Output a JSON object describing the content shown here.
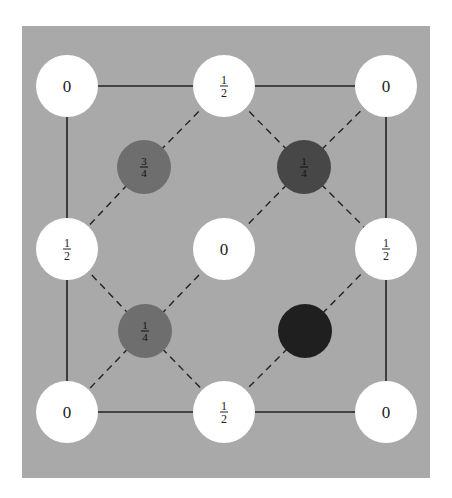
{
  "diagram": {
    "type": "crystal-structure-projection",
    "colors": {
      "page_background": "#ffffff",
      "panel_background": "#a9a9a9",
      "white_atom": "#ffffff",
      "dark_atom_medium": "#6e6e6e",
      "dark_atom_dark": "#474747",
      "dark_atom_darkest": "#1f1f1f",
      "line": "#222222",
      "label": "#222222"
    },
    "panel": {
      "x": 22,
      "y": 26,
      "width": 408,
      "height": 452
    },
    "square": {
      "x1": 67,
      "y1": 86,
      "x2": 386,
      "y2": 412
    },
    "white_atoms": [
      {
        "id": "corner-top-left",
        "cx": 67,
        "cy": 86,
        "label": "0"
      },
      {
        "id": "edge-top",
        "cx": 224,
        "cy": 86,
        "label": "½",
        "num": "1",
        "den": "2"
      },
      {
        "id": "corner-top-right",
        "cx": 386,
        "cy": 86,
        "label": "0"
      },
      {
        "id": "edge-left",
        "cx": 67,
        "cy": 249,
        "label": "½",
        "num": "1",
        "den": "2"
      },
      {
        "id": "center",
        "cx": 224,
        "cy": 249,
        "label": "0"
      },
      {
        "id": "edge-right",
        "cx": 386,
        "cy": 249,
        "label": "½",
        "num": "1",
        "den": "2"
      },
      {
        "id": "corner-bottom-left",
        "cx": 67,
        "cy": 412,
        "label": "0"
      },
      {
        "id": "edge-bottom",
        "cx": 224,
        "cy": 412,
        "label": "½",
        "num": "1",
        "den": "2"
      },
      {
        "id": "corner-bottom-right",
        "cx": 386,
        "cy": 412,
        "label": "0"
      }
    ],
    "white_atom_radius": 31,
    "dark_atoms": [
      {
        "id": "interior-top-left",
        "cx": 144,
        "cy": 167,
        "num": "3",
        "den": "4",
        "shade": "dark_atom_medium"
      },
      {
        "id": "interior-top-right",
        "cx": 304,
        "cy": 167,
        "num": "1",
        "den": "4",
        "shade": "dark_atom_dark"
      },
      {
        "id": "interior-bottom-left",
        "cx": 145,
        "cy": 331,
        "num": "1",
        "den": "4",
        "shade": "dark_atom_medium"
      },
      {
        "id": "interior-bottom-right",
        "cx": 305,
        "cy": 331,
        "num": "",
        "den": "",
        "shade": "dark_atom_darkest"
      }
    ],
    "dark_atom_radius": 27,
    "dashed_bonds": [
      [
        "edge-top",
        "interior-top-left"
      ],
      [
        "interior-top-left",
        "edge-left"
      ],
      [
        "edge-top",
        "interior-top-right"
      ],
      [
        "corner-top-right",
        "interior-top-right"
      ],
      [
        "interior-top-right",
        "center"
      ],
      [
        "interior-top-right",
        "edge-right"
      ],
      [
        "edge-left",
        "interior-bottom-left"
      ],
      [
        "center",
        "interior-bottom-left"
      ],
      [
        "interior-bottom-left",
        "corner-bottom-left"
      ],
      [
        "interior-bottom-left",
        "edge-bottom"
      ],
      [
        "edge-right",
        "interior-bottom-right"
      ],
      [
        "interior-bottom-right",
        "edge-bottom"
      ]
    ]
  }
}
